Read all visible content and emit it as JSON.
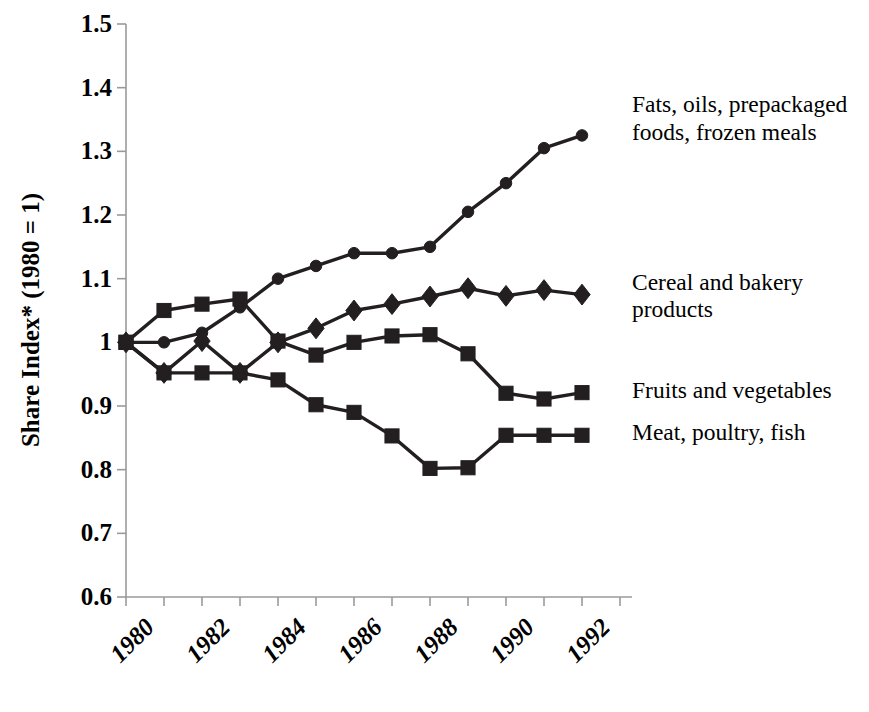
{
  "axes": {
    "ylabel": "Share Index* (1980 = 1)",
    "yticks": [
      "1.5",
      "1.4",
      "1.3",
      "1.2",
      "1.1",
      "1",
      "0.9",
      "0.8",
      "0.7",
      "0.6"
    ],
    "xticks": [
      "1980",
      "1982",
      "1984",
      "1986",
      "1988",
      "1990",
      "1992"
    ]
  },
  "legend": {
    "fats": "Fats, oils, prepackaged\nfoods, frozen meals",
    "cereal": "Cereal and bakery\nproducts",
    "fruits": "Fruits and vegetables",
    "meat": "Meat, poultry, fish"
  },
  "style": {
    "line_color": "#231f20",
    "axis_color": "#9a9a9a",
    "text_color": "#000000"
  },
  "chart_data": {
    "type": "line",
    "title": "",
    "xlabel": "",
    "ylabel": "Share Index* (1980 = 1)",
    "xlim": [
      1980,
      1993
    ],
    "ylim": [
      0.6,
      1.5
    ],
    "ytick_values": [
      0.6,
      0.7,
      0.8,
      0.9,
      1.0,
      1.1,
      1.2,
      1.3,
      1.4,
      1.5
    ],
    "xtick_values": [
      1980,
      1982,
      1984,
      1986,
      1988,
      1990,
      1992
    ],
    "grid": false,
    "legend_position": "right-inline-at-series-end",
    "x": [
      1980,
      1981,
      1982,
      1983,
      1984,
      1985,
      1986,
      1987,
      1988,
      1989,
      1990,
      1991,
      1992,
      1993
    ],
    "series": [
      {
        "name": "Fats, oils, prepackaged foods, frozen meals",
        "marker": "circle",
        "values": [
          1.0,
          1.0,
          1.015,
          1.055,
          1.1,
          1.12,
          1.14,
          1.14,
          1.15,
          1.205,
          1.25,
          1.305,
          1.325,
          null
        ]
      },
      {
        "name": "Cereal and bakery products",
        "marker": "diamond",
        "values": [
          1.0,
          0.952,
          1.002,
          0.952,
          1.0,
          1.022,
          1.05,
          1.06,
          1.072,
          1.085,
          1.073,
          1.082,
          1.075,
          null
        ]
      },
      {
        "name": "Fruits and vegetables",
        "marker": "square",
        "values": [
          1.0,
          1.05,
          1.06,
          1.068,
          1.002,
          0.98,
          1.0,
          1.01,
          1.012,
          0.982,
          0.92,
          0.911,
          0.921,
          null
        ]
      },
      {
        "name": "Meat, poultry, fish",
        "marker": "square",
        "values": [
          1.0,
          0.952,
          0.952,
          0.952,
          0.941,
          0.902,
          0.89,
          0.853,
          0.802,
          0.803,
          0.854,
          0.854,
          0.854,
          null
        ]
      }
    ]
  }
}
